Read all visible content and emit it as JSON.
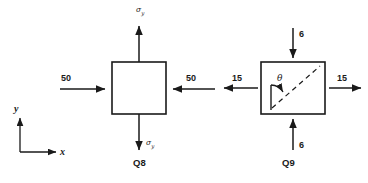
{
  "figure": {
    "background_color": "#ffffff",
    "stroke_color": "#1a1a1a"
  },
  "axes": {
    "x_label": "x",
    "y_label": "y"
  },
  "elements": [
    {
      "id": "Q8",
      "caption": "Q8",
      "loads": {
        "top": {
          "value": "σ",
          "subscript": "y",
          "direction": "up",
          "type": "tensile-normal"
        },
        "bottom": {
          "value": "σ",
          "subscript": "y",
          "direction": "down",
          "type": "tensile-normal"
        },
        "left": {
          "value": "50",
          "direction": "right",
          "type": "compressive-normal"
        },
        "right": {
          "value": "50",
          "direction": "left",
          "type": "compressive-normal"
        }
      }
    },
    {
      "id": "Q9",
      "caption": "Q9",
      "loads": {
        "top": {
          "value": "6",
          "direction": "down",
          "type": "compressive-normal"
        },
        "bottom": {
          "value": "6",
          "direction": "up",
          "type": "compressive-normal"
        },
        "left": {
          "value": "15",
          "direction": "left",
          "type": "tensile-normal"
        },
        "right": {
          "value": "15",
          "direction": "right",
          "type": "tensile-normal"
        }
      },
      "angle": {
        "symbol": "θ",
        "from": "vertical-reference-line",
        "to": "inclined-plane-normal",
        "inclined_plane_style": "dashed"
      }
    }
  ],
  "labels": {
    "sigma_y_top": "σ",
    "sigma_y_top_sub": "y",
    "sigma_y_bottom": "σ",
    "sigma_y_bottom_sub": "y",
    "left_50": "50",
    "right_50": "50",
    "left_15": "15",
    "right_15": "15",
    "top_6": "6",
    "bottom_6": "6",
    "theta": "θ",
    "caption_q8": "Q8",
    "caption_q9": "Q9",
    "axis_x": "x",
    "axis_y": "y"
  }
}
